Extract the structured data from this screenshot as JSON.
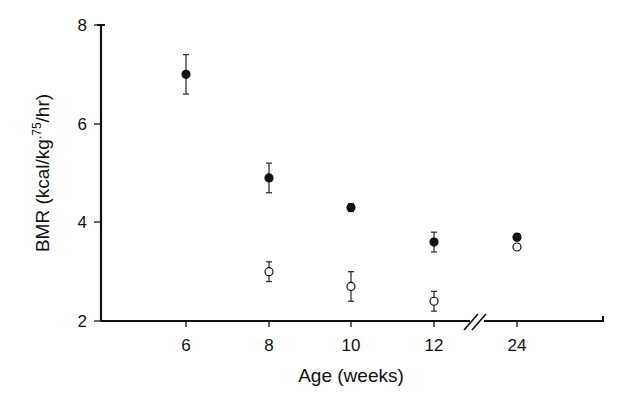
{
  "chart_data": {
    "type": "scatter",
    "title": "",
    "xlabel": "Age (weeks)",
    "ylabel": "BMR (kcal/kg·⁷⁵/hr)",
    "ylabel_parts": {
      "main": "BMR (kcal/kg",
      "sup": ".75",
      "tail": "/hr)"
    },
    "categories": [
      "6",
      "8",
      "10",
      "12",
      "24"
    ],
    "x_axis_break_between": [
      "12",
      "24"
    ],
    "ylim": [
      2,
      8
    ],
    "yticks": [
      "2",
      "4",
      "6",
      "8"
    ],
    "grid": false,
    "legend": null,
    "series": [
      {
        "name": "filled circles",
        "marker": "filled",
        "x": [
          "6",
          "8",
          "10",
          "12",
          "24"
        ],
        "values": [
          7.0,
          4.9,
          4.3,
          3.6,
          3.7
        ],
        "error": [
          0.4,
          0.3,
          0.08,
          0.2,
          0.07
        ]
      },
      {
        "name": "open circles",
        "marker": "open",
        "x": [
          "8",
          "10",
          "12",
          "24"
        ],
        "values": [
          3.0,
          2.7,
          2.4,
          3.5
        ],
        "error": [
          0.2,
          0.3,
          0.2,
          0.0
        ]
      }
    ]
  },
  "labels": {
    "xlabel": "Age (weeks)",
    "ylabel_main": "BMR (kcal/kg",
    "ylabel_sup": ".75",
    "ylabel_tail": "/hr)",
    "yticks": [
      "8",
      "6",
      "4",
      "2"
    ],
    "xticks": [
      "6",
      "8",
      "10",
      "12",
      "24"
    ]
  }
}
